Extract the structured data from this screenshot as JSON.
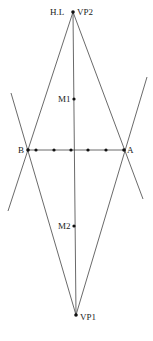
{
  "diagram": {
    "type": "perspective-construction",
    "labels": {
      "hl": "H.L",
      "vp2": "VP2",
      "vp1": "VP1",
      "m1": "M1",
      "m2": "M2",
      "a": "A",
      "b": "B"
    },
    "points": {
      "VP2": [
        73,
        12
      ],
      "VP1": [
        76,
        315
      ],
      "M1": [
        74,
        99
      ],
      "M2": [
        74,
        226
      ],
      "A": [
        124,
        150
      ],
      "B": [
        28,
        150
      ]
    },
    "division_points_on_BA": [
      36,
      54,
      71,
      88,
      106
    ],
    "colors": {
      "line": "#444444",
      "point": "#111111",
      "background": "#ffffff"
    }
  }
}
